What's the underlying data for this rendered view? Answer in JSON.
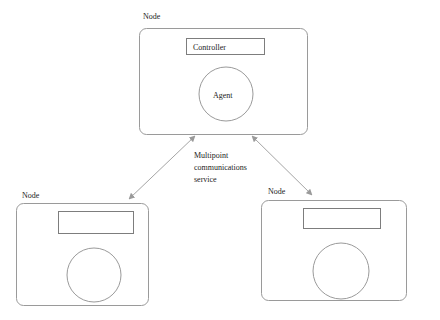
{
  "diagram": {
    "stroke_color": "#9a9a9a",
    "text_color": "#1c1c1c",
    "background_color": "#ffffff",
    "nodes": [
      {
        "id": "top-node",
        "label": "Node",
        "controller_label": "Controller",
        "agent_label": "Agent"
      },
      {
        "id": "bottom-left-node",
        "label": "Node",
        "controller_label": "",
        "agent_label": ""
      },
      {
        "id": "bottom-right-node",
        "label": "Node",
        "controller_label": "",
        "agent_label": ""
      }
    ],
    "connector_label": {
      "line1": "Multipoint",
      "line2": "communications",
      "line3": "service"
    },
    "connectors": [
      {
        "id": "top-to-bottom-left",
        "from": "top-node",
        "to": "bottom-left-node",
        "arrowheads": "both"
      },
      {
        "id": "top-to-bottom-right",
        "from": "top-node",
        "to": "bottom-right-node",
        "arrowheads": "both"
      }
    ]
  }
}
